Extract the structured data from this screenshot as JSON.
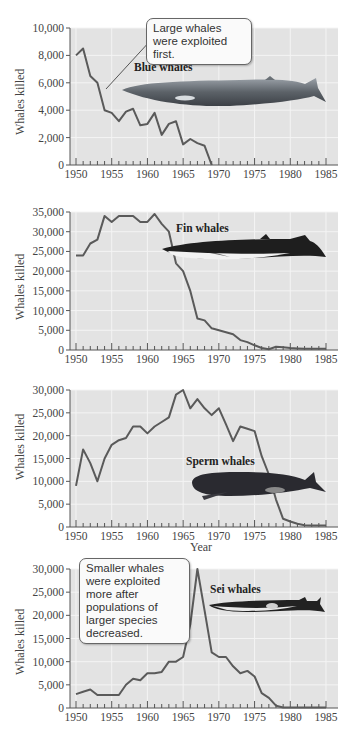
{
  "figure": {
    "ylabel": "Whales killed",
    "xlabel": "Year",
    "callouts": {
      "blue": "Large whales were exploited first.",
      "sei": "Smaller whales were exploited more after populations of larger species decreased."
    },
    "colors": {
      "plot_bg": "#e3e3e3",
      "grid": "#f4f4f4",
      "line": "#5a5a5a",
      "axis": "#555555"
    }
  },
  "chart_data": [
    {
      "type": "line",
      "title": "Blue whales",
      "xlabel": "",
      "ylabel": "Whales killed",
      "xlim": [
        1950,
        1985
      ],
      "ylim": [
        0,
        10000
      ],
      "xticks": [
        1950,
        1955,
        1960,
        1965,
        1970,
        1975,
        1980,
        1985
      ],
      "yticks": [
        0,
        2000,
        4000,
        6000,
        8000,
        10000
      ],
      "ytick_labels": [
        "0",
        "2,000",
        "4,000",
        "6,000",
        "8,000",
        "10,000"
      ],
      "annotation": "Large whales were exploited first.",
      "x": [
        1950,
        1951,
        1952,
        1953,
        1954,
        1955,
        1956,
        1957,
        1958,
        1959,
        1960,
        1961,
        1962,
        1963,
        1964,
        1965,
        1966,
        1967,
        1968,
        1969
      ],
      "values": [
        8000,
        8500,
        6500,
        6000,
        4000,
        3800,
        3200,
        3900,
        4100,
        2900,
        3000,
        3800,
        2200,
        3000,
        3200,
        1500,
        1900,
        1600,
        1400,
        0
      ]
    },
    {
      "type": "line",
      "title": "Fin whales",
      "xlabel": "",
      "ylabel": "Whales killed",
      "xlim": [
        1950,
        1985
      ],
      "ylim": [
        0,
        35000
      ],
      "xticks": [
        1950,
        1955,
        1960,
        1965,
        1970,
        1975,
        1980,
        1985
      ],
      "yticks": [
        0,
        5000,
        10000,
        15000,
        20000,
        25000,
        30000,
        35000
      ],
      "ytick_labels": [
        "0",
        "5,000",
        "10,000",
        "15,000",
        "20,000",
        "25,000",
        "30,000",
        "35,000"
      ],
      "x": [
        1950,
        1951,
        1952,
        1953,
        1954,
        1955,
        1956,
        1957,
        1958,
        1959,
        1960,
        1961,
        1962,
        1963,
        1964,
        1965,
        1966,
        1967,
        1968,
        1969,
        1970,
        1971,
        1972,
        1973,
        1974,
        1975,
        1976,
        1977,
        1978,
        1979,
        1980,
        1981,
        1982,
        1983,
        1984,
        1985
      ],
      "values": [
        24000,
        24000,
        27000,
        28000,
        34000,
        32500,
        34000,
        34000,
        34000,
        32500,
        32500,
        34500,
        32000,
        30000,
        22000,
        20000,
        15000,
        8000,
        7500,
        5500,
        5000,
        4500,
        4000,
        2500,
        2000,
        1200,
        500,
        200,
        800,
        700,
        500,
        400,
        300,
        300,
        300,
        300
      ]
    },
    {
      "type": "line",
      "title": "Sperm whales",
      "xlabel": "Year",
      "ylabel": "Whales killed",
      "xlim": [
        1950,
        1985
      ],
      "ylim": [
        0,
        30000
      ],
      "xticks": [
        1950,
        1955,
        1960,
        1965,
        1970,
        1975,
        1980,
        1985
      ],
      "yticks": [
        0,
        5000,
        10000,
        15000,
        20000,
        25000,
        30000
      ],
      "ytick_labels": [
        "0",
        "5,000",
        "10,000",
        "15,000",
        "20,000",
        "25,000",
        "30,000"
      ],
      "x": [
        1950,
        1951,
        1952,
        1953,
        1954,
        1955,
        1956,
        1957,
        1958,
        1959,
        1960,
        1961,
        1962,
        1963,
        1964,
        1965,
        1966,
        1967,
        1968,
        1969,
        1970,
        1971,
        1972,
        1973,
        1974,
        1975,
        1976,
        1977,
        1978,
        1979,
        1980,
        1981,
        1982,
        1983,
        1984,
        1985
      ],
      "values": [
        9000,
        17000,
        14000,
        10000,
        15000,
        18000,
        19000,
        19500,
        22000,
        22000,
        20500,
        22000,
        23000,
        24000,
        29000,
        30000,
        26000,
        28000,
        26000,
        24500,
        26000,
        22500,
        18800,
        22000,
        21500,
        21000,
        15500,
        11500,
        6000,
        1800,
        1200,
        700,
        400,
        300,
        300,
        300
      ]
    },
    {
      "type": "line",
      "title": "Sei whales",
      "xlabel": "",
      "ylabel": "Whales killed",
      "xlim": [
        1950,
        1985
      ],
      "ylim": [
        0,
        30000
      ],
      "xticks": [
        1950,
        1955,
        1960,
        1965,
        1970,
        1975,
        1980,
        1985
      ],
      "yticks": [
        0,
        5000,
        10000,
        15000,
        20000,
        25000,
        30000
      ],
      "ytick_labels": [
        "0",
        "5,000",
        "10,000",
        "15,000",
        "20,000",
        "25,000",
        "30,000"
      ],
      "annotation": "Smaller whales were exploited more after populations of larger species decreased.",
      "x": [
        1950,
        1951,
        1952,
        1953,
        1954,
        1955,
        1956,
        1957,
        1958,
        1959,
        1960,
        1961,
        1962,
        1963,
        1964,
        1965,
        1966,
        1967,
        1968,
        1969,
        1970,
        1971,
        1972,
        1973,
        1974,
        1975,
        1976,
        1977,
        1978,
        1979,
        1980,
        1981,
        1982,
        1983,
        1984,
        1985
      ],
      "values": [
        3000,
        3500,
        4000,
        2800,
        2800,
        2800,
        2800,
        5000,
        6300,
        6000,
        7500,
        7500,
        7800,
        10000,
        10000,
        11000,
        18000,
        30000,
        21000,
        12000,
        11000,
        11000,
        9000,
        7500,
        8000,
        6800,
        3200,
        2200,
        500,
        100,
        100,
        100,
        100,
        100,
        100,
        100
      ]
    }
  ]
}
